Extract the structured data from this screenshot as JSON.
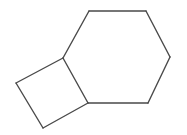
{
  "image": {
    "kind": "chemical-structure-diagram",
    "title": "Bicyclo[4.2.0]octane skeletal structure",
    "width": 187,
    "height": 135,
    "background_color": "#ffffff"
  },
  "style": {
    "bond_color": "#4a4a4a",
    "bond_width": 1.4,
    "bond_linecap": "round",
    "bond_linejoin": "round"
  },
  "chart_data": {
    "type": "diagram",
    "xlabel": "",
    "ylabel": "",
    "xlim": [
      0,
      187
    ],
    "ylim": [
      0,
      135
    ],
    "grid": false,
    "legend": "none",
    "vertices": [
      {
        "id": "C1",
        "label": "",
        "x": 63,
        "y": 58,
        "role": "ring-fusion-atom"
      },
      {
        "id": "C2",
        "label": "",
        "x": 89,
        "y": 11,
        "role": "cyclohexane-atom"
      },
      {
        "id": "C3",
        "label": "",
        "x": 146,
        "y": 11,
        "role": "cyclohexane-atom"
      },
      {
        "id": "C4",
        "label": "",
        "x": 170,
        "y": 57,
        "role": "cyclohexane-atom"
      },
      {
        "id": "C5",
        "label": "",
        "x": 148,
        "y": 103,
        "role": "cyclohexane-atom"
      },
      {
        "id": "C6",
        "label": "",
        "x": 88,
        "y": 103,
        "role": "ring-fusion-atom"
      },
      {
        "id": "C7",
        "label": "",
        "x": 43,
        "y": 128,
        "role": "cyclobutane-atom"
      },
      {
        "id": "C8",
        "label": "",
        "x": 16,
        "y": 83,
        "role": "cyclobutane-atom"
      }
    ],
    "bonds": [
      {
        "id": "b1",
        "from": "C1",
        "to": "C2",
        "order": 1,
        "ring": "cyclohexane"
      },
      {
        "id": "b2",
        "from": "C2",
        "to": "C3",
        "order": 1,
        "ring": "cyclohexane"
      },
      {
        "id": "b3",
        "from": "C3",
        "to": "C4",
        "order": 1,
        "ring": "cyclohexane"
      },
      {
        "id": "b4",
        "from": "C4",
        "to": "C5",
        "order": 1,
        "ring": "cyclohexane"
      },
      {
        "id": "b5",
        "from": "C5",
        "to": "C6",
        "order": 1,
        "ring": "cyclohexane"
      },
      {
        "id": "b6",
        "from": "C6",
        "to": "C1",
        "order": 1,
        "ring": "shared-fusion-bond"
      },
      {
        "id": "b7",
        "from": "C6",
        "to": "C7",
        "order": 1,
        "ring": "cyclobutane"
      },
      {
        "id": "b8",
        "from": "C7",
        "to": "C8",
        "order": 1,
        "ring": "cyclobutane"
      },
      {
        "id": "b9",
        "from": "C8",
        "to": "C1",
        "order": 1,
        "ring": "cyclobutane"
      }
    ],
    "rings": [
      {
        "id": "ring-cyclohexane",
        "name": "cyclohexane",
        "size": 6,
        "atoms": [
          "C1",
          "C2",
          "C3",
          "C4",
          "C5",
          "C6"
        ]
      },
      {
        "id": "ring-cyclobutane",
        "name": "cyclobutane",
        "size": 4,
        "atoms": [
          "C1",
          "C6",
          "C7",
          "C8"
        ]
      }
    ],
    "annotations": [],
    "atom_labels": []
  }
}
